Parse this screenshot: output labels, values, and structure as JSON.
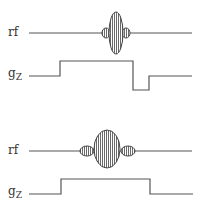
{
  "diagram": {
    "title": "",
    "colors": {
      "line": "#555555",
      "lobe_fill": "#9a9a9a",
      "lobe_stroke": "#444444",
      "background": "#ffffff"
    },
    "panels": [
      {
        "id": "top",
        "rf_label": "rf",
        "gz_label": "g",
        "gz_subscript": "Z",
        "rf_pulse": "sinc pulse with narrow tall main lobe and small side lobes",
        "gz_waveform": "slice-select gradient followed by negative refocusing lobe"
      },
      {
        "id": "bottom",
        "rf_label": "rf",
        "gz_label": "g",
        "gz_subscript": "Z",
        "rf_pulse": "sinc pulse with wider main lobe and side lobes",
        "gz_waveform": "slice-select gradient without refocusing lobe"
      }
    ]
  }
}
